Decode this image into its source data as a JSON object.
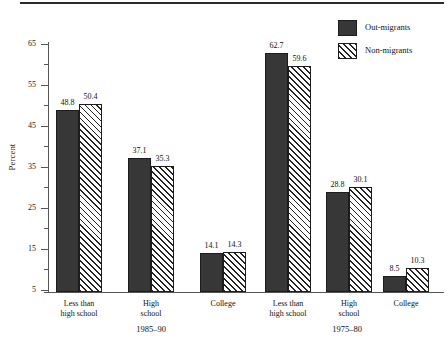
{
  "chart_data": {
    "type": "bar",
    "title": "",
    "subtitle": "",
    "xlabel": "",
    "ylabel": "Percent",
    "ylim": [
      4.5,
      65
    ],
    "yticks": [
      5,
      15,
      25,
      35,
      45,
      55,
      65
    ],
    "ytick_labels": [
      "5",
      "15",
      "25",
      "35",
      "45",
      "55",
      "65"
    ],
    "minor_ticks": [
      10,
      20,
      30,
      40,
      50,
      60
    ],
    "grid": false,
    "legend_position": "top-right",
    "categories": [
      "Less than\nhigh school",
      "High\nschool",
      "College",
      "Less than\nhigh school",
      "High\nschool",
      "College"
    ],
    "group_labels": [
      "1985–90",
      "1975–80"
    ],
    "series": [
      {
        "name": "Out-migrants",
        "pattern": "solid",
        "color": "#373737",
        "values": [
          48.8,
          37.1,
          14.1,
          62.7,
          28.8,
          8.5
        ]
      },
      {
        "name": "Non-migrants",
        "pattern": "diagonal-hatch",
        "color": "#ffffff",
        "values": [
          50.4,
          35.3,
          14.3,
          59.6,
          30.1,
          10.3
        ]
      }
    ],
    "bars": [
      {
        "group": 0,
        "series": 0,
        "category": "Less than\nhigh school",
        "value": 48.8,
        "label": "48.8"
      },
      {
        "group": 0,
        "series": 1,
        "category": "Less than\nhigh school",
        "value": 50.4,
        "label": "50.4"
      },
      {
        "group": 1,
        "series": 0,
        "category": "High\nschool",
        "value": 37.1,
        "label": "37.1"
      },
      {
        "group": 1,
        "series": 1,
        "category": "High\nschool",
        "value": 35.3,
        "label": "35.3"
      },
      {
        "group": 2,
        "series": 0,
        "category": "College",
        "value": 14.1,
        "label": "14.1"
      },
      {
        "group": 2,
        "series": 1,
        "category": "College",
        "value": 14.3,
        "label": "14.3"
      },
      {
        "group": 3,
        "series": 0,
        "category": "Less than\nhigh school",
        "value": 62.7,
        "label": "62.7"
      },
      {
        "group": 3,
        "series": 1,
        "category": "Less than\nhigh school",
        "value": 59.6,
        "label": "59.6"
      },
      {
        "group": 4,
        "series": 0,
        "category": "High\nschool",
        "value": 28.8,
        "label": "28.8"
      },
      {
        "group": 4,
        "series": 1,
        "category": "High\nschool",
        "value": 30.1,
        "label": "30.1"
      },
      {
        "group": 5,
        "series": 0,
        "category": "College",
        "value": 8.5,
        "label": "8.5"
      },
      {
        "group": 5,
        "series": 1,
        "category": "College",
        "value": 10.3,
        "label": "10.3"
      }
    ]
  },
  "legend": {
    "items": [
      {
        "label": "Out-migrants",
        "pattern": "solid"
      },
      {
        "label": "Non-migrants",
        "pattern": "diagonal-hatch"
      }
    ]
  },
  "axis": {
    "y_title": "Percent"
  },
  "colors": {
    "bar_solid": "#373737",
    "bar_outline": "#1c1c1c",
    "hatch_line": "#222222",
    "axis": "#555555",
    "rule": "#2b2b2b",
    "text": "#111111",
    "background": "#ffffff"
  }
}
